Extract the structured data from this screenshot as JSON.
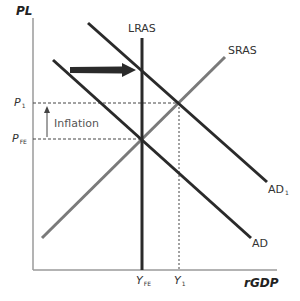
{
  "diagram": {
    "type": "AD-AS model",
    "axes": {
      "y_label": "PL",
      "x_label": "rGDP"
    },
    "curves": {
      "lras": "LRAS",
      "sras": "SRAS",
      "ad": "AD",
      "ad1": {
        "base": "AD",
        "sub": "1"
      }
    },
    "price_levels": {
      "p1": {
        "base": "P",
        "sub": "1"
      },
      "pfe": {
        "base": "P",
        "sub": "FE"
      }
    },
    "outputs": {
      "yfe": {
        "base": "Y",
        "sub": "FE"
      },
      "y1": {
        "base": "Y",
        "sub": "1"
      }
    },
    "annotations": {
      "inflation": "Inflation",
      "shift_arrow": "AD shifts right to AD1"
    },
    "colors": {
      "axis": "#9a9a9a",
      "dark_line": "#2a2a2a",
      "sras_line": "#7a7a7a",
      "dashed": "#444444",
      "text": "#333333"
    }
  }
}
